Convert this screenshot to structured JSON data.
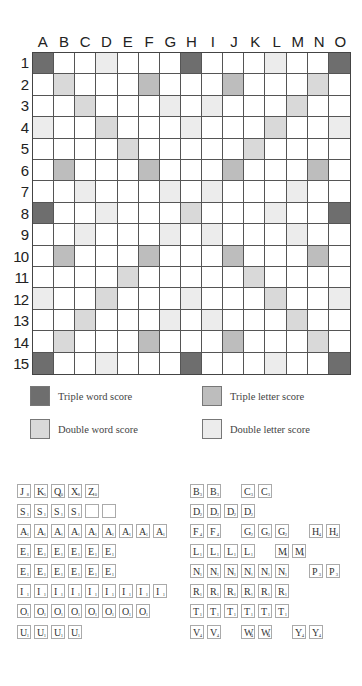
{
  "board": {
    "columns": [
      "A",
      "B",
      "C",
      "D",
      "E",
      "F",
      "G",
      "H",
      "I",
      "J",
      "K",
      "L",
      "M",
      "N",
      "O"
    ],
    "rows": [
      "1",
      "2",
      "3",
      "4",
      "5",
      "6",
      "7",
      "8",
      "9",
      "10",
      "11",
      "12",
      "13",
      "14",
      "15"
    ],
    "colors": {
      "tw": "#6e6e6e",
      "dw": "#d9d9d9",
      "tl": "#bdbdbd",
      "dl": "#ececec",
      "plain": "#ffffff"
    },
    "layout": [
      [
        "tw",
        "",
        "",
        "dl",
        "",
        "",
        "",
        "tw",
        "",
        "",
        "",
        "dl",
        "",
        "",
        "tw"
      ],
      [
        "",
        "dw",
        "",
        "",
        "",
        "tl",
        "",
        "",
        "",
        "tl",
        "",
        "",
        "",
        "dw",
        ""
      ],
      [
        "",
        "",
        "dw",
        "",
        "",
        "",
        "dl",
        "",
        "dl",
        "",
        "",
        "",
        "dw",
        "",
        ""
      ],
      [
        "dl",
        "",
        "",
        "dw",
        "",
        "",
        "",
        "dl",
        "",
        "",
        "",
        "dw",
        "",
        "",
        "dl"
      ],
      [
        "",
        "",
        "",
        "",
        "dw",
        "",
        "",
        "",
        "",
        "",
        "dw",
        "",
        "",
        "",
        ""
      ],
      [
        "",
        "tl",
        "",
        "",
        "",
        "tl",
        "",
        "",
        "",
        "tl",
        "",
        "",
        "",
        "tl",
        ""
      ],
      [
        "",
        "",
        "dl",
        "",
        "",
        "",
        "dl",
        "",
        "dl",
        "",
        "",
        "",
        "dl",
        "",
        ""
      ],
      [
        "tw",
        "",
        "",
        "dl",
        "",
        "",
        "",
        "dw",
        "",
        "",
        "",
        "dl",
        "",
        "",
        "tw"
      ],
      [
        "",
        "",
        "dl",
        "",
        "",
        "",
        "dl",
        "",
        "dl",
        "",
        "",
        "",
        "dl",
        "",
        ""
      ],
      [
        "",
        "tl",
        "",
        "",
        "",
        "tl",
        "",
        "",
        "",
        "tl",
        "",
        "",
        "",
        "tl",
        ""
      ],
      [
        "",
        "",
        "",
        "",
        "dw",
        "",
        "",
        "",
        "",
        "",
        "dw",
        "",
        "",
        "",
        ""
      ],
      [
        "dl",
        "",
        "",
        "dw",
        "",
        "",
        "",
        "dl",
        "",
        "",
        "",
        "dw",
        "",
        "",
        "dl"
      ],
      [
        "",
        "",
        "dw",
        "",
        "",
        "",
        "dl",
        "",
        "dl",
        "",
        "",
        "",
        "dw",
        "",
        ""
      ],
      [
        "",
        "dw",
        "",
        "",
        "",
        "tl",
        "",
        "",
        "",
        "tl",
        "",
        "",
        "",
        "dw",
        ""
      ],
      [
        "tw",
        "",
        "",
        "dl",
        "",
        "",
        "",
        "tw",
        "",
        "",
        "",
        "dl",
        "",
        "",
        "tw"
      ]
    ]
  },
  "legend": {
    "triple_word": "Triple word score",
    "triple_letter": "Triple letter score",
    "double_word": "Double word score",
    "double_letter": "Double letter score"
  },
  "tiles": {
    "left": [
      [
        [
          "J",
          "8"
        ],
        [
          "K",
          "5"
        ],
        [
          "Q",
          "10"
        ],
        [
          "X",
          "8"
        ],
        [
          "Z",
          "10"
        ]
      ],
      [
        [
          "S",
          "1"
        ],
        [
          "S",
          "1"
        ],
        [
          "S",
          "1"
        ],
        [
          "S",
          "1"
        ],
        [
          "",
          ""
        ],
        [
          "",
          ""
        ]
      ],
      [
        [
          "A",
          "1"
        ],
        [
          "A",
          "1"
        ],
        [
          "A",
          "1"
        ],
        [
          "A",
          "1"
        ],
        [
          "A",
          "1"
        ],
        [
          "A",
          "1"
        ],
        [
          "A",
          "1"
        ],
        [
          "A",
          "1"
        ],
        [
          "A",
          "1"
        ]
      ],
      [
        [
          "E",
          "1"
        ],
        [
          "E",
          "1"
        ],
        [
          "E",
          "1"
        ],
        [
          "E",
          "1"
        ],
        [
          "E",
          "1"
        ],
        [
          "E",
          "1"
        ]
      ],
      [
        [
          "E",
          "1"
        ],
        [
          "E",
          "1"
        ],
        [
          "E",
          "1"
        ],
        [
          "E",
          "1"
        ],
        [
          "E",
          "1"
        ],
        [
          "E",
          "1"
        ]
      ],
      [
        [
          "I",
          "1"
        ],
        [
          "I",
          "1"
        ],
        [
          "I",
          "1"
        ],
        [
          "I",
          "1"
        ],
        [
          "I",
          "1"
        ],
        [
          "I",
          "1"
        ],
        [
          "I",
          "1"
        ],
        [
          "I",
          "1"
        ],
        [
          "I",
          "1"
        ]
      ],
      [
        [
          "O",
          "1"
        ],
        [
          "O",
          "1"
        ],
        [
          "O",
          "1"
        ],
        [
          "O",
          "1"
        ],
        [
          "O",
          "1"
        ],
        [
          "O",
          "1"
        ],
        [
          "O",
          "1"
        ],
        [
          "O",
          "1"
        ]
      ],
      [
        [
          "U",
          "1"
        ],
        [
          "U",
          "1"
        ],
        [
          "U",
          "1"
        ],
        [
          "U",
          "1"
        ]
      ]
    ],
    "right": [
      [
        [
          "B",
          "3"
        ],
        [
          "B",
          "3"
        ],
        null,
        [
          "C",
          "3"
        ],
        [
          "C",
          "3"
        ]
      ],
      [
        [
          "D",
          "2"
        ],
        [
          "D",
          "2"
        ],
        [
          "D",
          "2"
        ],
        [
          "D",
          "2"
        ]
      ],
      [
        [
          "F",
          "4"
        ],
        [
          "F",
          "4"
        ],
        null,
        [
          "G",
          "2"
        ],
        [
          "G",
          "2"
        ],
        [
          "G",
          "2"
        ],
        null,
        [
          "H",
          "4"
        ],
        [
          "H",
          "4"
        ]
      ],
      [
        [
          "L",
          "1"
        ],
        [
          "L",
          "1"
        ],
        [
          "L",
          "1"
        ],
        [
          "L",
          "1"
        ],
        null,
        [
          "M",
          "3"
        ],
        [
          "M",
          "3"
        ]
      ],
      [
        [
          "N",
          "1"
        ],
        [
          "N",
          "1"
        ],
        [
          "N",
          "1"
        ],
        [
          "N",
          "1"
        ],
        [
          "N",
          "1"
        ],
        [
          "N",
          "1"
        ],
        null,
        [
          "P",
          "3"
        ],
        [
          "P",
          "3"
        ]
      ],
      [
        [
          "R",
          "1"
        ],
        [
          "R",
          "1"
        ],
        [
          "R",
          "1"
        ],
        [
          "R",
          "1"
        ],
        [
          "R",
          "1"
        ],
        [
          "R",
          "1"
        ]
      ],
      [
        [
          "T",
          "1"
        ],
        [
          "T",
          "1"
        ],
        [
          "T",
          "1"
        ],
        [
          "T",
          "1"
        ],
        [
          "T",
          "1"
        ],
        [
          "T",
          "1"
        ]
      ],
      [
        [
          "V",
          "4"
        ],
        [
          "V",
          "4"
        ],
        null,
        [
          "W",
          "4"
        ],
        [
          "W",
          "4"
        ],
        null,
        [
          "Y",
          "4"
        ],
        [
          "Y",
          "4"
        ]
      ]
    ]
  }
}
